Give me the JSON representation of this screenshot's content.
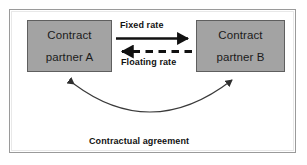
{
  "diagram": {
    "frame": {
      "border_color": "#9a9a9a",
      "background_color": "#ffffff"
    },
    "nodes": [
      {
        "id": "party-a",
        "line1": "Contract",
        "line2": "partner A",
        "fill_color": "#a3a3a3",
        "border_color": "#5f5f5f",
        "text_color": "#1b1b1b"
      },
      {
        "id": "party-b",
        "line1": "Contract",
        "line2": "partner B",
        "fill_color": "#a3a3a3",
        "border_color": "#5f5f5f",
        "text_color": "#1b1b1b"
      }
    ],
    "connectors": [
      {
        "id": "fixed-rate",
        "label": "Fixed rate",
        "style": "solid",
        "direction": "left-to-right",
        "color": "#111111"
      },
      {
        "id": "floating-rate",
        "label": "Floating rate",
        "style": "dashed",
        "direction": "right-to-left",
        "color": "#111111"
      },
      {
        "id": "contractual-agreement",
        "label": "Contractual agreement",
        "style": "curved-double-headed",
        "direction": "bidirectional",
        "color": "#3a3a3a"
      }
    ]
  }
}
